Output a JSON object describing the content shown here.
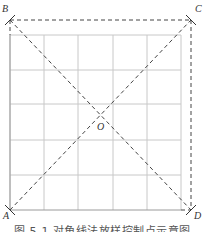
{
  "diagram": {
    "type": "grid-with-diagonals",
    "grid": {
      "columns": 5,
      "rows": 5,
      "x_lines": [
        10,
        44,
        78,
        113,
        147,
        181
      ],
      "y_lines": [
        35,
        70,
        104,
        140,
        175,
        210
      ],
      "color": "#c8c8c8"
    },
    "points": {
      "A": {
        "label": "A",
        "x": 10,
        "y": 210
      },
      "B": {
        "label": "B",
        "x": 10,
        "y": 20
      },
      "C": {
        "label": "C",
        "x": 191,
        "y": 20
      },
      "D": {
        "label": "D",
        "x": 191,
        "y": 210
      },
      "O": {
        "label": "O",
        "x": 100,
        "y": 115
      }
    },
    "dashed_color": "#444444",
    "caption": "图 5-1  对角线法放样控制点示意图"
  }
}
